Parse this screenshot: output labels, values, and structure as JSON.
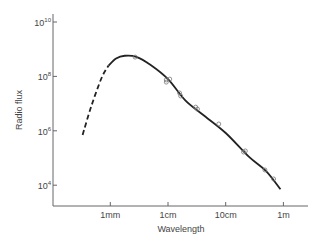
{
  "chart_data": {
    "type": "line",
    "title": "",
    "xlabel": "Wavelength",
    "ylabel": "Radio flux",
    "x_scale": "log",
    "y_scale": "log",
    "x_ticks": [
      {
        "label": "1mm",
        "log10_m": -3
      },
      {
        "label": "1cm",
        "log10_m": -2
      },
      {
        "label": "10cm",
        "log10_m": -1
      },
      {
        "label": "1m",
        "log10_m": 0
      }
    ],
    "y_ticks": [
      {
        "base": "10",
        "exp": "10",
        "log10": 10
      },
      {
        "base": "10",
        "exp": "8",
        "log10": 8
      },
      {
        "base": "10",
        "exp": "6",
        "log10": 6
      },
      {
        "base": "10",
        "exp": "4",
        "log10": 4
      }
    ],
    "xlim_log10_m": [
      -3.95,
      0.38
    ],
    "ylim_log10": [
      10.2,
      3.25
    ],
    "grid": false,
    "legend": null,
    "series": [
      {
        "name": "extrapolated spectrum",
        "style": "dashed",
        "points_log10": [
          [
            -3.48,
            5.85
          ],
          [
            -3.33,
            6.9
          ],
          [
            -3.15,
            7.95
          ],
          [
            -3.03,
            8.4
          ]
        ]
      },
      {
        "name": "fitted spectrum",
        "style": "solid",
        "points_log10": [
          [
            -3.03,
            8.4
          ],
          [
            -2.9,
            8.66
          ],
          [
            -2.75,
            8.76
          ],
          [
            -2.55,
            8.72
          ],
          [
            -2.3,
            8.42
          ],
          [
            -2.0,
            7.9
          ],
          [
            -1.7,
            7.12
          ],
          [
            -1.4,
            6.6
          ],
          [
            -1.0,
            5.92
          ],
          [
            -0.6,
            5.05
          ],
          [
            -0.3,
            4.52
          ],
          [
            -0.05,
            3.85
          ]
        ]
      },
      {
        "name": "observations",
        "style": "markers",
        "marker": "open-circle",
        "points_log10": [
          [
            -2.57,
            8.71
          ],
          [
            -2.03,
            7.87
          ],
          [
            -1.97,
            7.9
          ],
          [
            -2.03,
            7.79
          ],
          [
            -1.8,
            7.39
          ],
          [
            -1.78,
            7.28
          ],
          [
            -1.52,
            6.87
          ],
          [
            -1.49,
            6.8
          ],
          [
            -1.12,
            6.25
          ],
          [
            -0.69,
            5.22
          ],
          [
            -0.66,
            5.26
          ],
          [
            -0.32,
            4.56
          ],
          [
            -0.17,
            4.23
          ]
        ]
      }
    ]
  },
  "colors": {
    "axis": "#666666",
    "curve": "#222222",
    "marker": "#777777",
    "text": "#444444"
  }
}
